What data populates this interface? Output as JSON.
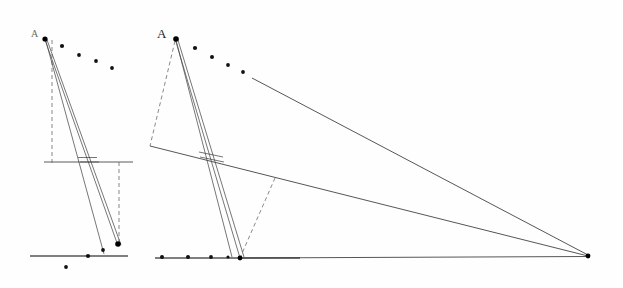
{
  "figure": {
    "background_color": "#fefefe",
    "ink_color": "#2b2b2b",
    "width": 623,
    "height": 288
  },
  "left_figure": {
    "name": "orthographic-projection-left",
    "apex_label": "A",
    "apex_label_position": {
      "x": 33,
      "y": 36
    },
    "apex_point": {
      "x": 44,
      "y": 38
    },
    "convergence_point": {
      "x": 117,
      "y": 243
    },
    "ground_line": {
      "x1": 30,
      "y1": 256,
      "x2": 128,
      "y2": 256
    },
    "picture_line": {
      "x1": 44,
      "y1": 162,
      "x2": 133,
      "y2": 162
    },
    "vertical_dashes": [
      {
        "x1": 52,
        "y1": 40,
        "x2": 52,
        "y2": 162
      },
      {
        "x1": 119,
        "y1": 162,
        "x2": 119,
        "y2": 246
      }
    ],
    "rays": [
      {
        "x1": 44,
        "y1": 38,
        "x2": 117,
        "y2": 243
      },
      {
        "x1": 46,
        "y1": 38,
        "x2": 121,
        "y2": 244
      },
      {
        "x1": 45,
        "y1": 39,
        "x2": 103,
        "y2": 253
      }
    ],
    "trace_segment": {
      "x1": 78,
      "y1": 158,
      "x2": 96,
      "y2": 158
    },
    "arc_points": [
      {
        "x": 45,
        "y": 39
      },
      {
        "x": 62,
        "y": 46
      },
      {
        "x": 79,
        "y": 55
      },
      {
        "x": 96,
        "y": 61
      },
      {
        "x": 112,
        "y": 68
      }
    ],
    "ground_points": [
      {
        "x": 88,
        "y": 256
      },
      {
        "x": 103,
        "y": 250
      },
      {
        "x": 66,
        "y": 267
      },
      {
        "x": 117,
        "y": 243
      }
    ]
  },
  "right_figure": {
    "name": "perspective-projection-right",
    "apex_label": "A",
    "apex_label_position": {
      "x": 158,
      "y": 36
    },
    "apex_point": {
      "x": 175,
      "y": 38
    },
    "station_point": {
      "x": 240,
      "y": 258
    },
    "vanishing_point": {
      "x": 588,
      "y": 256
    },
    "ground_line": {
      "x1": 155,
      "y1": 258,
      "x2": 300,
      "y2": 258
    },
    "rays": [
      {
        "x1": 175,
        "y1": 38,
        "x2": 240,
        "y2": 258
      },
      {
        "x1": 177,
        "y1": 38,
        "x2": 243,
        "y2": 257
      },
      {
        "x1": 176,
        "y1": 39,
        "x2": 231,
        "y2": 256
      }
    ],
    "dashed_lines": [
      {
        "x1": 175,
        "y1": 40,
        "x2": 150,
        "y2": 146
      },
      {
        "x1": 275,
        "y1": 178,
        "x2": 240,
        "y2": 258
      }
    ],
    "horizon_line": {
      "x1": 150,
      "y1": 146,
      "x2": 588,
      "y2": 256
    },
    "convergent_rays": [
      {
        "x1": 252,
        "y1": 78,
        "x2": 588,
        "y2": 256
      },
      {
        "x1": 240,
        "y1": 258,
        "x2": 588,
        "y2": 256
      }
    ],
    "trace_segment": {
      "x1": 200,
      "y1": 155,
      "x2": 222,
      "y2": 155
    },
    "arc_points": [
      {
        "x": 176,
        "y": 39
      },
      {
        "x": 195,
        "y": 48
      },
      {
        "x": 212,
        "y": 57
      },
      {
        "x": 227,
        "y": 65
      },
      {
        "x": 242,
        "y": 72
      }
    ],
    "ground_points": [
      {
        "x": 162,
        "y": 257
      },
      {
        "x": 188,
        "y": 257
      },
      {
        "x": 211,
        "y": 257
      },
      {
        "x": 228,
        "y": 257
      }
    ]
  }
}
